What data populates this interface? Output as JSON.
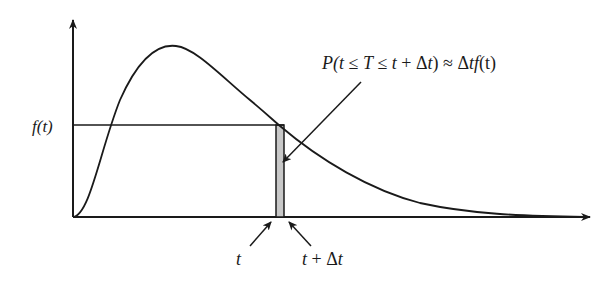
{
  "diagram": {
    "y_label": "f(t)",
    "annotation": "P(t ≤ T ≤ t + Δt) ≈ Δtf(t)",
    "annotation_parts": {
      "p_open": "P(",
      "t1": "t",
      "le1": " ≤ ",
      "T": "T",
      "le2": " ≤ ",
      "t2": "t",
      "plus": " + Δ",
      "t3": "t",
      "close_approx": ") ≈ Δ",
      "tf": "tf",
      "paren_t": "(t)"
    },
    "tick_t": "t",
    "tick_t_dt": "t + Δt",
    "tick_t_dt_parts": {
      "t": "t",
      "plus_delta": " + Δ",
      "t2": "t"
    },
    "colors": {
      "line": "#1a1a1a",
      "shaded_bar": "#c8c8c8",
      "background": "#ffffff"
    }
  }
}
